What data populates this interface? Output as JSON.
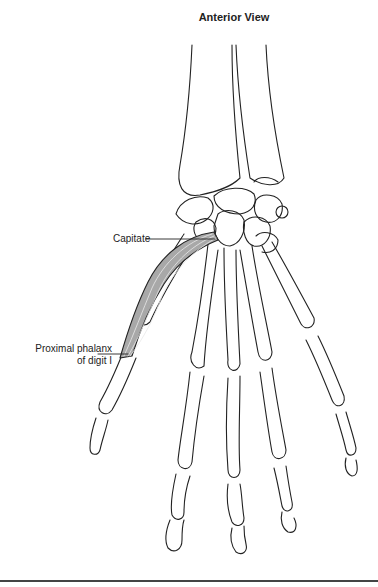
{
  "figure": {
    "title": "Anterior View",
    "labels": {
      "capitate": "Capitate",
      "phalanx_line1": "Proximal phalanx",
      "phalanx_line2": "of digit I"
    },
    "colors": {
      "bone_outline": "#222222",
      "muscle_fill": "#a8a8a8",
      "muscle_fiber": "#e8e8e8",
      "background": "#ffffff",
      "rule": "#444444"
    }
  }
}
